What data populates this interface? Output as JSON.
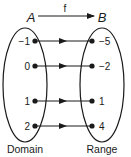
{
  "function_name": "f",
  "domain_set": {
    "name": "A",
    "caption": "Domain",
    "elements": [
      "−1",
      "0",
      "1",
      "2"
    ]
  },
  "range_set": {
    "name": "B",
    "caption": "Range",
    "elements": [
      "−5",
      "−2",
      "1",
      "4"
    ]
  },
  "mappings": [
    {
      "from": "−1",
      "to": "−5"
    },
    {
      "from": "0",
      "to": "−2"
    },
    {
      "from": "1",
      "to": "1"
    },
    {
      "from": "2",
      "to": "4"
    }
  ],
  "colors": {
    "ink": "#1a1a1a",
    "background": "#ffffff"
  }
}
